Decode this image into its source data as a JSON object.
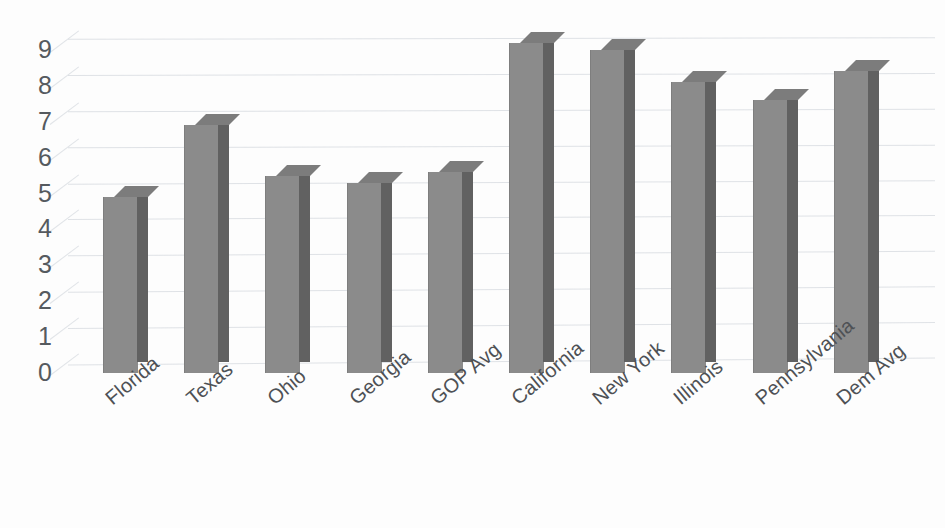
{
  "chart_data": {
    "type": "bar",
    "title": "",
    "xlabel": "",
    "ylabel": "",
    "categories": [
      "Florida",
      "Texas",
      "Ohio",
      "Georgia",
      "GOP Avg",
      "California",
      "New York",
      "Illinois",
      "Pennsylvania",
      "Dem Avg"
    ],
    "values": [
      4.9,
      6.9,
      5.5,
      5.3,
      5.6,
      9.2,
      9.0,
      8.1,
      7.6,
      8.4
    ],
    "ylim": [
      0,
      9.6
    ],
    "yticks": [
      "0",
      "1",
      "2",
      "3",
      "4",
      "5",
      "6",
      "7",
      "8",
      "9"
    ],
    "ytick_values": [
      0,
      1,
      2,
      3,
      4,
      5,
      6,
      7,
      8,
      9
    ],
    "grid": true,
    "legend": "none",
    "style": "3d-column",
    "series": [
      {
        "name": "",
        "values": [
          4.9,
          6.9,
          5.5,
          5.3,
          5.6,
          9.2,
          9.0,
          8.1,
          7.6,
          8.4
        ]
      }
    ]
  },
  "colors": {
    "bar_front": "#8b8b8b",
    "bar_side": "#616161",
    "bar_top": "#7c7c7c",
    "gridline": "#d9dde2",
    "tick_text": "#555a5f",
    "label_text": "#4e5155",
    "background": "#fdfdfd"
  }
}
